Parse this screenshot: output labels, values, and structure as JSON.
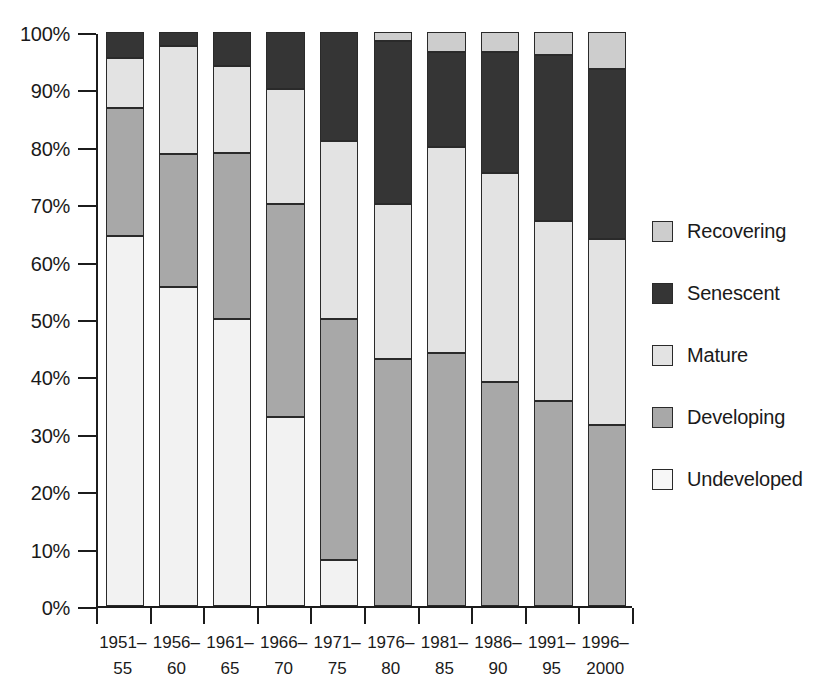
{
  "chart_data": {
    "type": "bar",
    "subtype": "stacked-bar-100-percent",
    "title": "",
    "xlabel": "",
    "ylabel": "",
    "ylim": [
      0,
      100
    ],
    "ytick_labels": [
      "0%",
      "10%",
      "20%",
      "30%",
      "40%",
      "50%",
      "60%",
      "70%",
      "80%",
      "90%",
      "100%"
    ],
    "ytick_values": [
      0,
      10,
      20,
      30,
      40,
      50,
      60,
      70,
      80,
      90,
      100
    ],
    "grid": false,
    "legend_position": "right",
    "categories": [
      "1951–55",
      "1956–60",
      "1961–65",
      "1966–70",
      "1971–75",
      "1976–80",
      "1981–85",
      "1986–90",
      "1991–95",
      "1996–2000"
    ],
    "category_lines": [
      {
        "l1": "1951–",
        "l2": "55"
      },
      {
        "l1": "1956–",
        "l2": "60"
      },
      {
        "l1": "1961–",
        "l2": "65"
      },
      {
        "l1": "1966–",
        "l2": "70"
      },
      {
        "l1": "1971–",
        "l2": "75"
      },
      {
        "l1": "1976–",
        "l2": "80"
      },
      {
        "l1": "1981–",
        "l2": "85"
      },
      {
        "l1": "1986–",
        "l2": "90"
      },
      {
        "l1": "1991–",
        "l2": "95"
      },
      {
        "l1": "1996–",
        "l2": "2000"
      }
    ],
    "series": [
      {
        "name": "Undeveloped",
        "color": "#f2f2f2",
        "values": [
          64.5,
          55.5,
          50.0,
          33.0,
          8.0,
          0.0,
          0.0,
          0.0,
          0.0,
          0.0
        ]
      },
      {
        "name": "Developing",
        "color": "#a8a8a8",
        "values": [
          22.3,
          23.3,
          29.0,
          37.0,
          42.0,
          43.0,
          44.0,
          39.0,
          35.7,
          31.5
        ]
      },
      {
        "name": "Mature",
        "color": "#e3e3e3",
        "values": [
          8.7,
          18.7,
          15.0,
          20.0,
          31.0,
          27.0,
          36.0,
          36.5,
          31.3,
          32.5
        ]
      },
      {
        "name": "Senescent",
        "color": "#353535",
        "values": [
          4.5,
          2.5,
          6.0,
          10.0,
          19.0,
          28.5,
          16.5,
          21.0,
          29.0,
          29.5
        ]
      },
      {
        "name": "Recovering",
        "color": "#cdcdcd",
        "values": [
          0.0,
          0.0,
          0.0,
          0.0,
          0.0,
          1.5,
          3.5,
          3.5,
          4.0,
          6.5
        ]
      }
    ],
    "stack_order_bottom_to_top": [
      "Undeveloped",
      "Developing",
      "Mature",
      "Senescent",
      "Recovering"
    ],
    "legend_order": [
      "Recovering",
      "Senescent",
      "Mature",
      "Developing",
      "Undeveloped"
    ]
  },
  "legend": {
    "items": [
      {
        "label": "Recovering",
        "color": "#cdcdcd"
      },
      {
        "label": "Senescent",
        "color": "#353535"
      },
      {
        "label": "Mature",
        "color": "#e3e3e3"
      },
      {
        "label": "Developing",
        "color": "#a8a8a8"
      },
      {
        "label": "Undeveloped",
        "color": "#f7f7f7"
      }
    ]
  },
  "colors": {
    "axis": "#1c1c1c",
    "segment_border": "#2a2a2a",
    "background": "#ffffff",
    "text": "#1a1a1a"
  }
}
